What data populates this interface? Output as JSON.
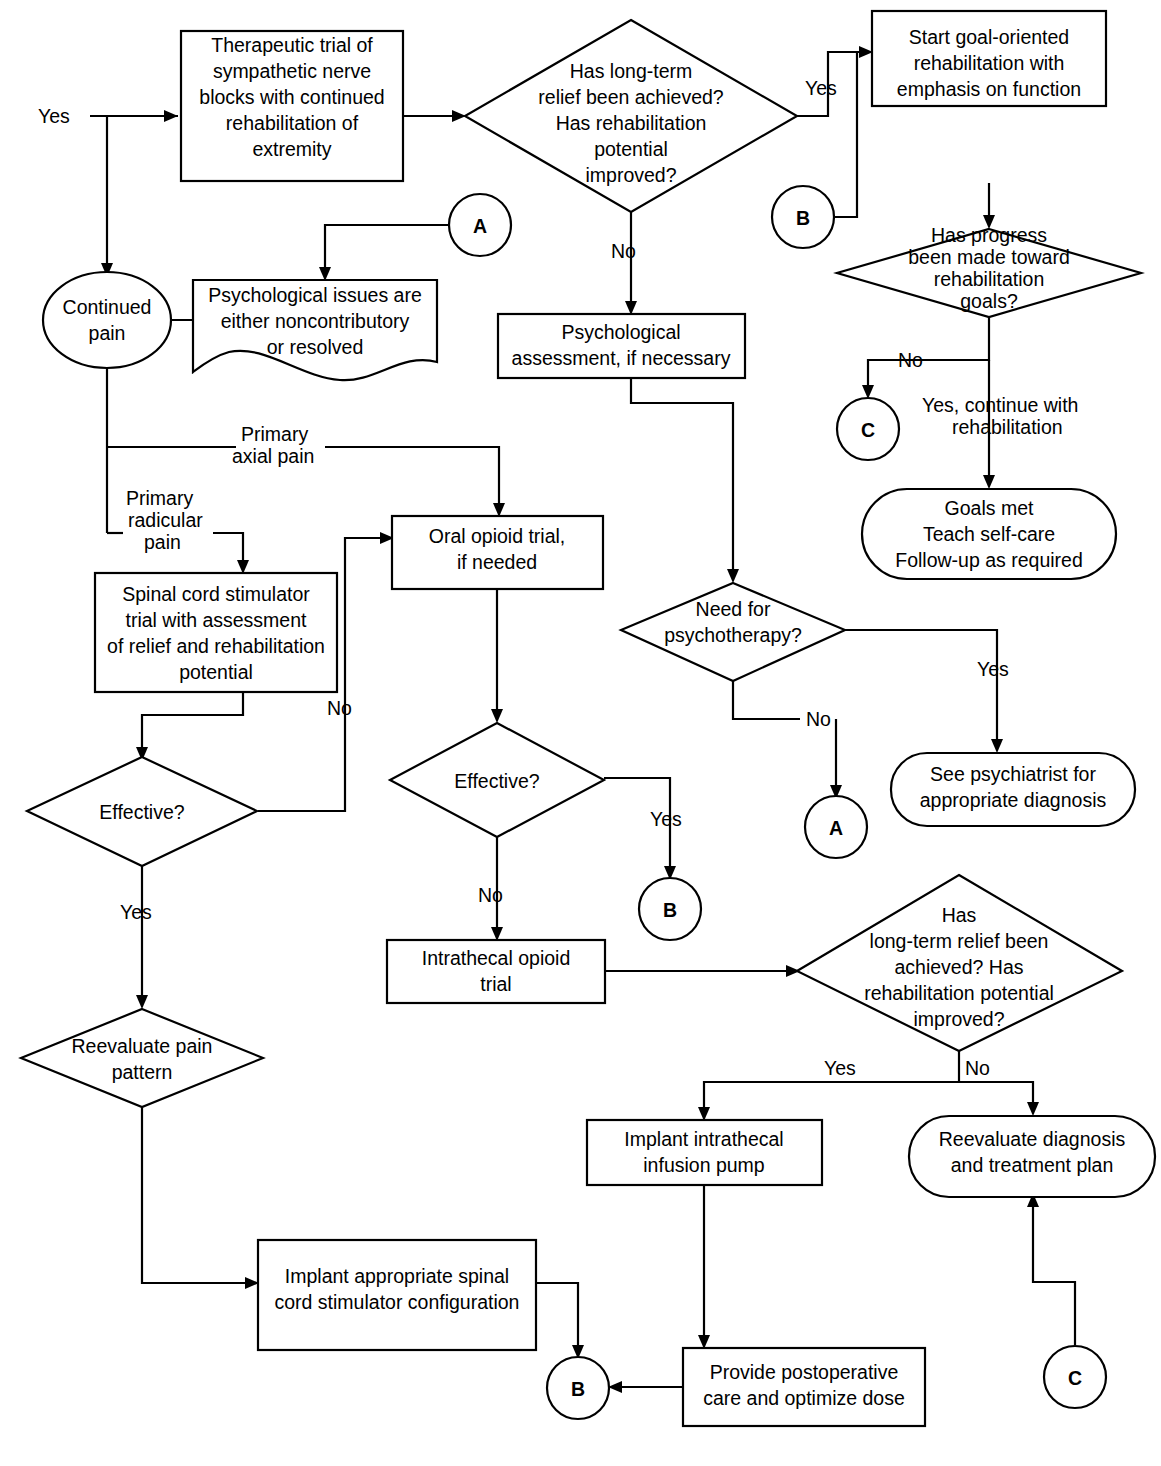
{
  "diagram": {
    "type": "flowchart",
    "orientation": "top-to-bottom",
    "stroke_color": "#000000",
    "fill_color": "#ffffff",
    "background": "#ffffff"
  },
  "nodes": {
    "therapeutic_trial": {
      "shape": "rectangle",
      "lines": [
        "Therapeutic trial of",
        "sympathetic nerve",
        "blocks with continued",
        "rehabilitation of",
        "extremity"
      ]
    },
    "longterm_relief_1": {
      "shape": "diamond",
      "lines": [
        "Has long-term",
        "relief been achieved?",
        "Has rehabilitation",
        "potential",
        "improved?"
      ]
    },
    "start_goal_rehab": {
      "shape": "rectangle",
      "lines": [
        "Start goal-oriented",
        "rehabilitation with",
        "emphasis on function"
      ]
    },
    "has_progress": {
      "shape": "diamond",
      "lines": [
        "Has progress",
        "been made toward",
        "rehabilitation",
        "goals?"
      ]
    },
    "continued_pain": {
      "shape": "circle-ellipse",
      "lines": [
        "Continued",
        "pain"
      ]
    },
    "psych_issues": {
      "shape": "document-wavy",
      "lines": [
        "Psychological issues are",
        "either noncontributory",
        "or resolved"
      ]
    },
    "psych_assessment": {
      "shape": "rectangle",
      "lines": [
        "Psychological",
        "assessment, if necessary"
      ]
    },
    "goals_met": {
      "shape": "rounded-stadium",
      "lines": [
        "Goals met",
        "Teach self-care",
        "Follow-up as required"
      ]
    },
    "oral_opioid": {
      "shape": "rectangle",
      "lines": [
        "Oral opioid trial,",
        "if needed"
      ]
    },
    "spinal_cord_stim_trial": {
      "shape": "rectangle",
      "lines": [
        "Spinal cord stimulator",
        "trial with assessment",
        "of relief and rehabilitation",
        "potential"
      ]
    },
    "need_psychotherapy": {
      "shape": "diamond",
      "lines": [
        "Need for",
        "psychotherapy?"
      ]
    },
    "effective_scs": {
      "shape": "diamond",
      "lines": [
        "Effective?"
      ]
    },
    "effective_opioid": {
      "shape": "diamond",
      "lines": [
        "Effective?"
      ]
    },
    "see_psychiatrist": {
      "shape": "rounded-stadium",
      "lines": [
        "See psychiatrist for",
        "appropriate diagnosis"
      ]
    },
    "intrathecal_trial": {
      "shape": "rectangle",
      "lines": [
        "Intrathecal opioid",
        "trial"
      ]
    },
    "longterm_relief_2": {
      "shape": "diamond",
      "lines": [
        "Has",
        "long-term relief been",
        "achieved? Has",
        "rehabilitation potential",
        "improved?"
      ]
    },
    "reevaluate_pain_pattern": {
      "shape": "diamond",
      "lines": [
        "Reevaluate pain",
        "pattern"
      ]
    },
    "implant_pump": {
      "shape": "rectangle",
      "lines": [
        "Implant intrathecal",
        "infusion pump"
      ]
    },
    "reevaluate_dx": {
      "shape": "rounded-stadium",
      "lines": [
        "Reevaluate diagnosis",
        "and treatment plan"
      ]
    },
    "implant_scs": {
      "shape": "rectangle",
      "lines": [
        "Implant appropriate spinal",
        "cord stimulator configuration"
      ]
    },
    "postop_care": {
      "shape": "rectangle",
      "lines": [
        "Provide postoperative",
        "care and optimize dose"
      ]
    }
  },
  "connectors": {
    "a1": {
      "label": "A",
      "shape": "circle"
    },
    "b1": {
      "label": "B",
      "shape": "circle"
    },
    "c1": {
      "label": "C",
      "shape": "circle"
    },
    "a2": {
      "label": "A",
      "shape": "circle"
    },
    "b2": {
      "label": "B",
      "shape": "circle"
    },
    "c2": {
      "label": "C",
      "shape": "circle"
    },
    "b3": {
      "label": "B",
      "shape": "circle"
    }
  },
  "edge_labels": {
    "yes_entry": "Yes",
    "yes_relief1": "Yes",
    "no_relief1": "No",
    "no_progress": "No",
    "yes_continue_rehab": [
      "Yes, continue with",
      "rehabilitation"
    ],
    "primary_axial_pain": [
      "Primary",
      "axial pain"
    ],
    "primary_radicular_pain": [
      "Primary",
      "radicular",
      "pain"
    ],
    "no_scs_effective": "No",
    "yes_scs_effective": "Yes",
    "yes_psychotherapy": "Yes",
    "no_psychotherapy": "No",
    "yes_opioid_effective": "Yes",
    "no_opioid_effective": "No",
    "yes_relief2": "Yes",
    "no_relief2": "No"
  }
}
